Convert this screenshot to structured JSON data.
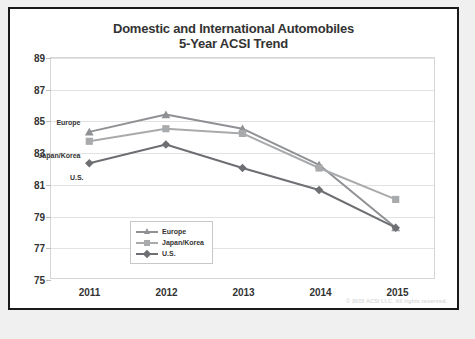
{
  "chart": {
    "title_line1": "Domestic and International Automobiles",
    "title_line2": "5-Year ACSI Trend",
    "copyright": "© 2015 ACSI LLC. All rights reserved."
  },
  "legend": {
    "items": [
      {
        "label": "Europe",
        "marker": "triangle-marker",
        "color": "#8f9194"
      },
      {
        "label": "Japan/Korea",
        "marker": "square-marker",
        "color": "#a8aaac"
      },
      {
        "label": "U.S.",
        "marker": "diamond-marker",
        "color": "#6d6f72"
      }
    ]
  },
  "inline_labels": [
    {
      "text": "Europe"
    },
    {
      "text": "Japan/Korea"
    },
    {
      "text": "U.S."
    }
  ],
  "chart_data": {
    "type": "line",
    "title": "Domestic and International Automobiles 5-Year ACSI Trend",
    "xlabel": "",
    "ylabel": "",
    "categories": [
      "2011",
      "2012",
      "2013",
      "2014",
      "2015"
    ],
    "ylim": [
      75,
      89
    ],
    "yticks": [
      75,
      77,
      79,
      81,
      83,
      85,
      87,
      89
    ],
    "grid": true,
    "legend_position": "inside-bottom-left",
    "series": [
      {
        "name": "Europe",
        "marker": "triangle",
        "color": "#8f9194",
        "values": [
          84.3,
          85.4,
          84.5,
          82.2,
          78.2
        ]
      },
      {
        "name": "Japan/Korea",
        "marker": "square",
        "color": "#a8aaac",
        "values": [
          83.7,
          84.5,
          84.2,
          82.0,
          80.0
        ]
      },
      {
        "name": "U.S.",
        "marker": "diamond",
        "color": "#6d6f72",
        "values": [
          82.3,
          83.5,
          82.0,
          80.6,
          78.2
        ]
      }
    ]
  }
}
